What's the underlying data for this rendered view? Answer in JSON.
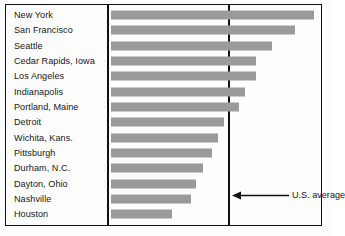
{
  "chart_data": {
    "type": "bar",
    "orientation": "horizontal",
    "title": "",
    "xlabel": "",
    "ylabel": "",
    "grid": false,
    "legend": null,
    "categories": [
      "New York",
      "San Francisco",
      "Seattle",
      "Cedar Rapids, Iowa",
      "Los Angeles",
      "Indianapolis",
      "Portland, Maine",
      "Detroit",
      "Wichita, Kans.",
      "Pittsburgh",
      "Durham, N.C.",
      "Dayton, Ohio",
      "Nashville",
      "Houston"
    ],
    "values": [
      203,
      184,
      161,
      145,
      145,
      134,
      128,
      113,
      107,
      101,
      92,
      85,
      80,
      61
    ],
    "value_unit": "px",
    "xlim": [
      0,
      211
    ],
    "annotations": [
      {
        "name": "us-average",
        "label": "U.S. average",
        "type": "vertical-reference-line",
        "value": 118,
        "arrow": "left"
      }
    ],
    "colors": {
      "bar": "#9a9a9a",
      "line": "#111111",
      "background": "#fdfdfd",
      "text": "#161616"
    }
  },
  "annotation": {
    "us_average_label": "U.S. average"
  }
}
